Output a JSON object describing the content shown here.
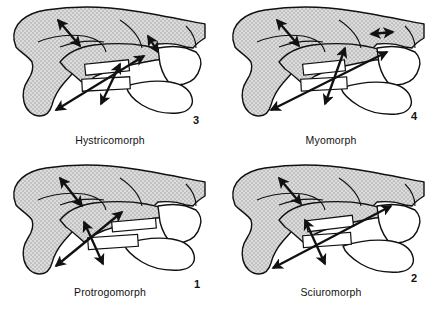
{
  "figure": {
    "background_color": "#ffffff",
    "outline_color": "#111111",
    "bone_fill_color": "#d4d4d4",
    "arrow_color": "#111111",
    "panel_count": 4
  },
  "panels": [
    {
      "id": "hystricomorph",
      "position": "top-left",
      "label": "Hystricomorph",
      "number": "3",
      "arrows": [
        {
          "name": "anterior-deep-masseter-arrow",
          "heads": "double"
        },
        {
          "name": "infraorbital-foramen-arrow",
          "heads": "double"
        },
        {
          "name": "superficial-masseter-arrow",
          "heads": "double"
        },
        {
          "name": "posterior-masseter-arrow",
          "heads": "double"
        }
      ]
    },
    {
      "id": "myomorph",
      "position": "top-right",
      "label": "Myomorph",
      "number": "4",
      "arrows": [
        {
          "name": "anterior-deep-masseter-arrow",
          "heads": "double"
        },
        {
          "name": "infraorbital-foramen-arrow",
          "heads": "double"
        },
        {
          "name": "superficial-masseter-arrow",
          "heads": "double"
        },
        {
          "name": "posterior-masseter-arrow",
          "heads": "double"
        }
      ]
    },
    {
      "id": "protrogomorph",
      "position": "bottom-left",
      "label": "Protrogomorph",
      "number": "1",
      "arrows": [
        {
          "name": "anterior-deep-masseter-arrow",
          "heads": "double"
        },
        {
          "name": "superficial-masseter-arrow",
          "heads": "double"
        },
        {
          "name": "posterior-masseter-arrow",
          "heads": "double"
        }
      ]
    },
    {
      "id": "sciuromorph",
      "position": "bottom-right",
      "label": "Sciuromorph",
      "number": "2",
      "arrows": [
        {
          "name": "anterior-deep-masseter-arrow",
          "heads": "double"
        },
        {
          "name": "superficial-masseter-arrow",
          "heads": "double"
        },
        {
          "name": "posterior-masseter-arrow",
          "heads": "double"
        }
      ]
    }
  ]
}
